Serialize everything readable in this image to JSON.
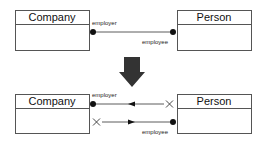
{
  "top": {
    "left_class": "Company",
    "right_class": "Person",
    "left_role": "employer",
    "right_role": "employee"
  },
  "transform_arrow": "down-arrow",
  "bottom": {
    "left_class": "Company",
    "right_class": "Person",
    "left_role": "employer",
    "right_role": "employee"
  },
  "colors": {
    "line": "#333333",
    "arrow": "#333333",
    "box_border": "#555555"
  }
}
